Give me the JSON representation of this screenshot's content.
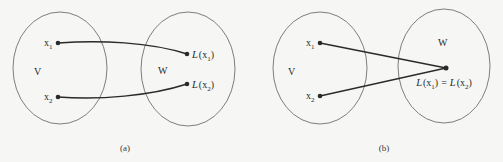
{
  "figure_a": {
    "caption": "(a)",
    "domain_set": {
      "label": "V"
    },
    "codomain_set": {
      "label": "W"
    },
    "points": [
      {
        "name": "x",
        "sub": "1",
        "image_fn": "L",
        "image_open": "(x",
        "image_sub": "1",
        "image_close": ")"
      },
      {
        "name": "x",
        "sub": "2",
        "image_fn": "L",
        "image_open": "(x",
        "image_sub": "2",
        "image_close": ")"
      }
    ]
  },
  "figure_b": {
    "caption": "(b)",
    "domain_set": {
      "label": "V"
    },
    "codomain_set": {
      "label": "W"
    },
    "points": [
      {
        "name": "x",
        "sub": "1"
      },
      {
        "name": "x",
        "sub": "2"
      }
    ],
    "image_label": {
      "left_fn": "L",
      "left_open": "(x",
      "left_sub": "1",
      "left_close": ")",
      "equals": "=",
      "right_fn": "L",
      "right_open": "(x",
      "right_sub": "2",
      "right_close": ")"
    }
  }
}
